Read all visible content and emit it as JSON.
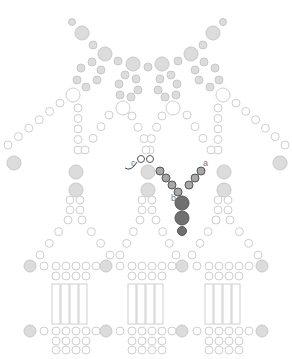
{
  "diagram": {
    "type": "beadwork-pattern",
    "labels": {
      "a": "a",
      "b": "b",
      "c": "c"
    },
    "colors": {
      "background": "#ffffff",
      "ghost_fill": "#dcdcdc",
      "ghost_stroke": "#c8c8c8",
      "outline_stroke": "#cfcfcf",
      "active_small": "#a8a8a8",
      "active_large": "#707070",
      "active_stroke": "#555555",
      "thread": "#444444"
    },
    "panels": 3
  }
}
